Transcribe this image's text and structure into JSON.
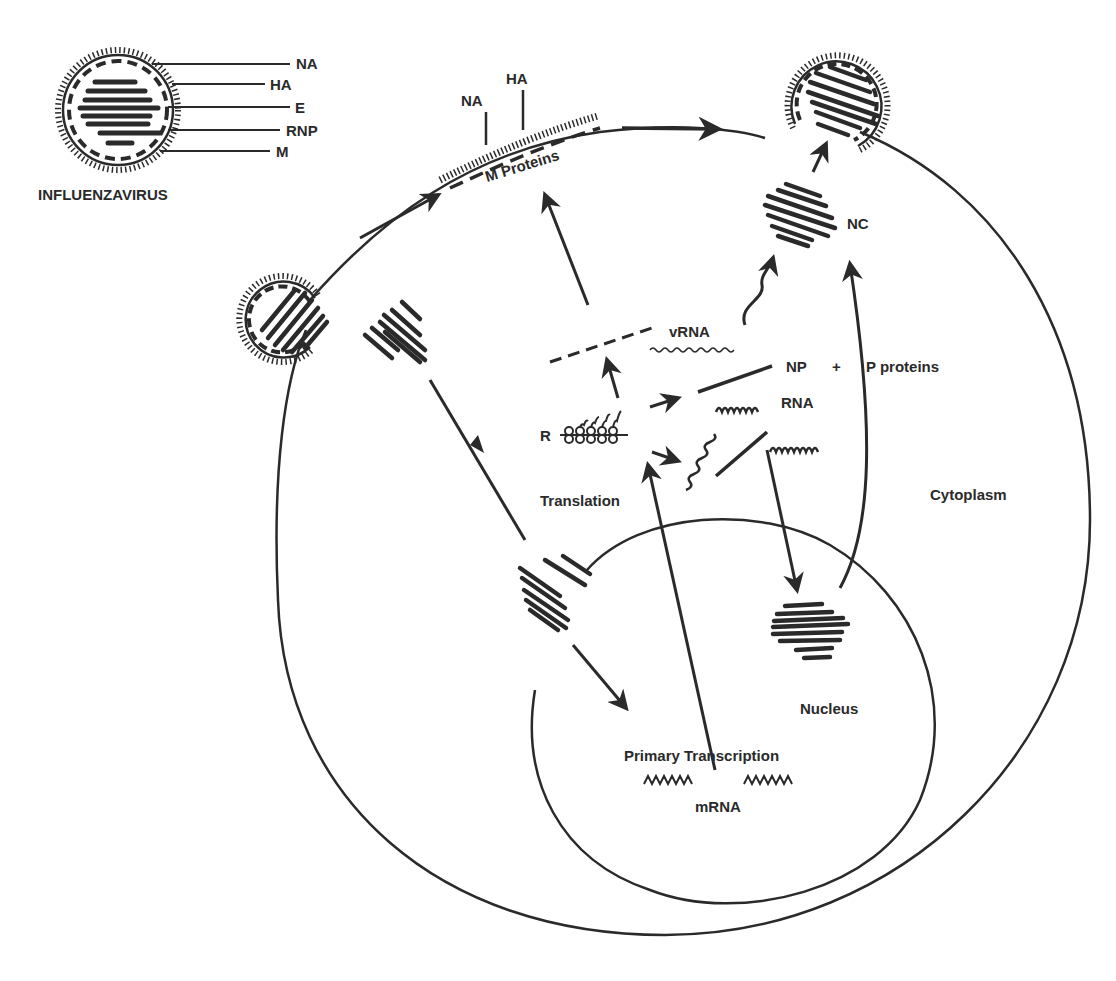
{
  "legend": {
    "virion_title": "INFLUENZAVIRUS",
    "parts": [
      {
        "label": "NA"
      },
      {
        "label": "HA"
      },
      {
        "label": "E"
      },
      {
        "label": "RNP"
      },
      {
        "label": "M"
      }
    ]
  },
  "membrane": {
    "na_label": "NA",
    "ha_label": "HA",
    "m_proteins_label": "M Proteins"
  },
  "cytoplasm": {
    "region_label": "Cytoplasm",
    "nc_label": "NC",
    "vrna_label": "vRNA",
    "np_label": "NP",
    "plus_label": "+",
    "p_proteins_label": "P proteins",
    "rna_label": "RNA",
    "ribosome_label": "R",
    "translation_label": "Translation"
  },
  "nucleus": {
    "region_label": "Nucleus",
    "primary_transcription_label": "Primary Transcription",
    "mrna_label": "mRNA"
  },
  "colors": {
    "ink": "#2a2a2a",
    "background": "#ffffff"
  }
}
